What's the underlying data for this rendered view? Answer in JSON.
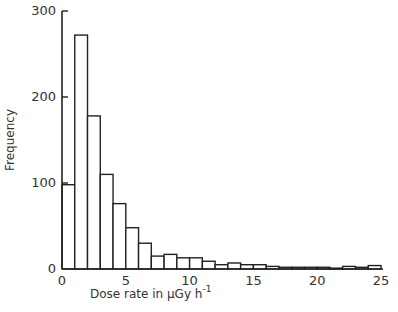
{
  "chart_data": {
    "type": "bar",
    "title": "",
    "xlabel": "Dose rate in µGy h",
    "xlabel_superscript": "-1",
    "ylabel": "Frequency",
    "xlim": [
      0,
      25
    ],
    "ylim": [
      0,
      300
    ],
    "x_ticks": [
      "0",
      "5",
      "10",
      "15",
      "20",
      "25"
    ],
    "y_ticks": [
      "0",
      "100",
      "200",
      "300"
    ],
    "grid": false,
    "legend": null,
    "bin_width": 1,
    "categories": [
      "0-1",
      "1-2",
      "2-3",
      "3-4",
      "4-5",
      "5-6",
      "6-7",
      "7-8",
      "8-9",
      "9-10",
      "10-11",
      "11-12",
      "12-13",
      "13-14",
      "14-15",
      "15-16",
      "16-17",
      "17-18",
      "18-19",
      "19-20",
      "20-21",
      "21-22",
      "22-23",
      "23-24",
      "24-25"
    ],
    "values": [
      98,
      272,
      178,
      110,
      76,
      48,
      30,
      15,
      17,
      13,
      13,
      9,
      5,
      7,
      5,
      5,
      3,
      2,
      2,
      2,
      2,
      1,
      3,
      2,
      4
    ]
  }
}
